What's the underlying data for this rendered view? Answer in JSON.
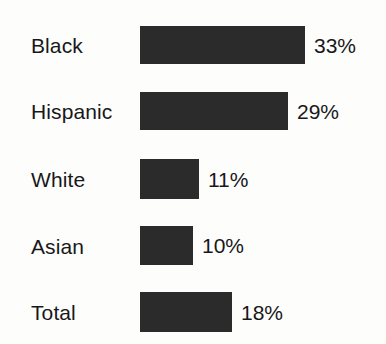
{
  "chart_data": {
    "type": "bar",
    "orientation": "horizontal",
    "title": "",
    "subtitle": "",
    "xlabel": "",
    "ylabel": "",
    "grid": false,
    "legend": false,
    "axis_visible": false,
    "xlim": [
      0,
      33
    ],
    "categories": [
      "Black",
      "Hispanic",
      "White",
      "Asian",
      "Total"
    ],
    "values": [
      33,
      29,
      11,
      10,
      18
    ],
    "value_labels": [
      "33%",
      "29%",
      "11%",
      "10%",
      "18%"
    ],
    "value_label_position": "outside-end",
    "bar_color": "#2b2b2b",
    "background_color": "#fdfdfc",
    "text_color": "#18181a",
    "rows": [
      {
        "label": "Black",
        "value": 33,
        "value_label": "33%"
      },
      {
        "label": "Hispanic",
        "value": 29,
        "value_label": "29%"
      },
      {
        "label": "White",
        "value": 11,
        "value_label": "11%"
      },
      {
        "label": "Asian",
        "value": 10,
        "value_label": "10%"
      },
      {
        "label": "Total",
        "value": 18,
        "value_label": "18%"
      }
    ]
  }
}
